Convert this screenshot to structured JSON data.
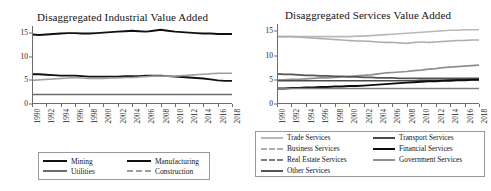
{
  "figure": {
    "background": "#ffffff"
  },
  "panels": [
    {
      "id": "industrial",
      "title": "Disaggregated Industrial Value Added",
      "legend": [
        {
          "label": "Mining",
          "color": "#111111",
          "width": 1.9,
          "dash": "none"
        },
        {
          "label": "Manufacturing",
          "color": "#111111",
          "width": 1.9,
          "dash": "none"
        },
        {
          "label": "Utilities",
          "color": "#6b6b6b",
          "width": 1.6,
          "dash": "none"
        },
        {
          "label": "Construction",
          "color": "#9e9e9e",
          "width": 1.6,
          "dash": "2,1"
        }
      ]
    },
    {
      "id": "services",
      "title": "Disaggregated Services Value Added",
      "legend": [
        {
          "label": "Trade Services",
          "color": "#b9b9b9",
          "width": 1.6,
          "dash": "none"
        },
        {
          "label": "Transport Services",
          "color": "#4a4a4a",
          "width": 1.7,
          "dash": "none"
        },
        {
          "label": "Business Services",
          "color": "#aeaeae",
          "width": 1.6,
          "dash": "2,1"
        },
        {
          "label": "Financial Services",
          "color": "#0d0d0d",
          "width": 1.9,
          "dash": "none"
        },
        {
          "label": "Real Estate Services",
          "color": "#7d7d7d",
          "width": 1.7,
          "dash": "2,1"
        },
        {
          "label": "Government Services",
          "color": "#8f8f8f",
          "width": 1.7,
          "dash": "none"
        },
        {
          "label": "Other Services",
          "color": "#555555",
          "width": 1.7,
          "dash": "none"
        }
      ]
    }
  ],
  "chart_data": [
    {
      "type": "line",
      "title": "Disaggregated Industrial Value Added",
      "xlabel": "",
      "ylabel": "",
      "xlim": [
        1990,
        2018
      ],
      "ylim": [
        0,
        16.5
      ],
      "yticks": [
        0,
        5,
        10,
        15
      ],
      "xticks": [
        1990,
        1992,
        1994,
        1996,
        1998,
        2000,
        2002,
        2004,
        2006,
        2008,
        2010,
        2012,
        2014,
        2016,
        2018
      ],
      "grid": false,
      "legend_position": "bottom",
      "x": [
        1990,
        1991,
        1992,
        1993,
        1994,
        1995,
        1996,
        1997,
        1998,
        1999,
        2000,
        2001,
        2002,
        2003,
        2004,
        2005,
        2006,
        2007,
        2008,
        2009,
        2010,
        2011,
        2012,
        2013,
        2014,
        2015,
        2016,
        2017,
        2018
      ],
      "series": [
        {
          "name": "Manufacturing",
          "color": "#111111",
          "values": [
            14.7,
            14.6,
            14.7,
            14.8,
            14.9,
            15.0,
            15.0,
            14.9,
            14.9,
            15.0,
            15.1,
            15.2,
            15.3,
            15.4,
            15.5,
            15.4,
            15.3,
            15.5,
            15.7,
            15.5,
            15.3,
            15.2,
            15.1,
            15.0,
            14.9,
            14.9,
            14.8,
            14.8,
            14.8
          ]
        },
        {
          "name": "Mining",
          "color": "#111111",
          "values": [
            6.3,
            6.3,
            6.2,
            6.1,
            6.0,
            6.0,
            6.0,
            5.9,
            5.8,
            5.8,
            5.8,
            5.8,
            5.8,
            5.9,
            5.9,
            5.9,
            6.0,
            6.0,
            6.0,
            5.9,
            5.8,
            5.7,
            5.6,
            5.5,
            5.4,
            5.2,
            5.0,
            4.9,
            4.9
          ]
        },
        {
          "name": "Construction",
          "color": "#9e9e9e",
          "values": [
            5.0,
            5.1,
            5.2,
            5.3,
            5.4,
            5.5,
            5.6,
            5.5,
            5.4,
            5.4,
            5.4,
            5.5,
            5.5,
            5.6,
            5.6,
            5.7,
            5.8,
            5.9,
            5.9,
            5.9,
            5.9,
            6.0,
            6.1,
            6.2,
            6.3,
            6.4,
            6.5,
            6.5,
            6.5
          ]
        },
        {
          "name": "Utilities",
          "color": "#6b6b6b",
          "values": [
            2.0,
            2.0,
            2.0,
            2.0,
            2.0,
            2.0,
            2.0,
            2.0,
            2.0,
            2.0,
            2.0,
            2.0,
            2.0,
            2.0,
            2.0,
            2.0,
            2.0,
            2.0,
            2.0,
            2.0,
            2.0,
            2.0,
            2.0,
            2.0,
            2.0,
            2.0,
            2.0,
            2.0,
            2.0
          ]
        }
      ]
    },
    {
      "type": "line",
      "title": "Disaggregated Services Value Added",
      "xlabel": "",
      "ylabel": "",
      "xlim": [
        1990,
        2018
      ],
      "ylim": [
        0,
        16.5
      ],
      "yticks": [
        0,
        5,
        10,
        15
      ],
      "xticks": [
        1990,
        1992,
        1994,
        1996,
        1998,
        2000,
        2002,
        2004,
        2006,
        2008,
        2010,
        2012,
        2014,
        2016,
        2018
      ],
      "grid": false,
      "legend_position": "bottom",
      "x": [
        1990,
        1991,
        1992,
        1993,
        1994,
        1995,
        1996,
        1997,
        1998,
        1999,
        2000,
        2001,
        2002,
        2003,
        2004,
        2005,
        2006,
        2007,
        2008,
        2009,
        2010,
        2011,
        2012,
        2013,
        2014,
        2015,
        2016,
        2017,
        2018
      ],
      "series": [
        {
          "name": "Trade Services",
          "color": "#b9b9b9",
          "values": [
            13.9,
            13.9,
            13.9,
            13.9,
            13.9,
            13.9,
            13.9,
            13.9,
            13.9,
            13.9,
            13.9,
            14.0,
            14.0,
            14.1,
            14.2,
            14.3,
            14.4,
            14.5,
            14.6,
            14.7,
            14.8,
            14.9,
            15.0,
            15.1,
            15.2,
            15.2,
            15.3,
            15.3,
            15.3
          ]
        },
        {
          "name": "Business Services",
          "color": "#aeaeae",
          "values": [
            13.9,
            13.9,
            13.9,
            13.8,
            13.7,
            13.6,
            13.5,
            13.4,
            13.3,
            13.2,
            13.1,
            13.0,
            13.0,
            12.9,
            12.8,
            12.7,
            12.7,
            12.6,
            12.5,
            12.7,
            12.8,
            12.7,
            12.8,
            12.9,
            13.0,
            13.1,
            13.1,
            13.2,
            13.2
          ]
        },
        {
          "name": "Government Services",
          "color": "#8f8f8f",
          "values": [
            5.0,
            5.0,
            5.1,
            5.1,
            5.2,
            5.3,
            5.4,
            5.4,
            5.5,
            5.6,
            5.7,
            5.8,
            5.9,
            6.0,
            6.2,
            6.4,
            6.5,
            6.6,
            6.7,
            6.9,
            7.0,
            7.2,
            7.3,
            7.5,
            7.6,
            7.7,
            7.8,
            7.9,
            8.0
          ]
        },
        {
          "name": "Other Services",
          "color": "#555555",
          "values": [
            6.2,
            6.1,
            6.1,
            6.0,
            5.9,
            5.9,
            5.8,
            5.8,
            5.7,
            5.7,
            5.6,
            5.6,
            5.5,
            5.5,
            5.4,
            5.4,
            5.4,
            5.3,
            5.3,
            5.3,
            5.3,
            5.3,
            5.3,
            5.3,
            5.3,
            5.3,
            5.3,
            5.3,
            5.3
          ]
        },
        {
          "name": "Transport Services",
          "color": "#4a4a4a",
          "values": [
            4.8,
            4.8,
            4.8,
            4.8,
            4.8,
            4.8,
            4.8,
            4.8,
            4.8,
            4.8,
            4.8,
            4.8,
            4.8,
            4.8,
            4.8,
            4.8,
            4.8,
            4.8,
            4.8,
            4.8,
            4.9,
            4.9,
            4.9,
            4.9,
            5.0,
            5.0,
            5.0,
            5.0,
            5.0
          ]
        },
        {
          "name": "Financial Services",
          "color": "#0d0d0d",
          "values": [
            3.2,
            3.2,
            3.3,
            3.3,
            3.4,
            3.4,
            3.5,
            3.5,
            3.6,
            3.6,
            3.7,
            3.7,
            3.8,
            3.9,
            4.0,
            4.1,
            4.2,
            4.3,
            4.4,
            4.5,
            4.6,
            4.7,
            4.7,
            4.8,
            4.8,
            4.9,
            4.9,
            5.0,
            5.0
          ]
        },
        {
          "name": "Real Estate Services",
          "color": "#7d7d7d",
          "values": [
            3.2,
            3.2,
            3.2,
            3.2,
            3.2,
            3.2,
            3.2,
            3.2,
            3.2,
            3.2,
            3.2,
            3.2,
            3.2,
            3.2,
            3.2,
            3.2,
            3.2,
            3.2,
            3.2,
            3.2,
            3.2,
            3.2,
            3.2,
            3.2,
            3.2,
            3.2,
            3.2,
            3.2,
            3.2
          ]
        }
      ]
    }
  ]
}
